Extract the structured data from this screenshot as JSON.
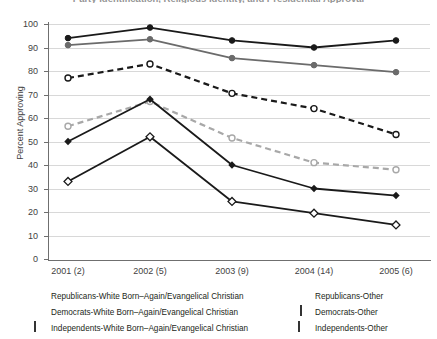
{
  "chart_data": {
    "type": "line",
    "title": "Party Identification, Religious Identity, and Presidential Approval",
    "xlabel": "",
    "ylabel": "Percent Approving",
    "categories": [
      "2001 (2)",
      "2002 (5)",
      "2003 (9)",
      "2004 (14)",
      "2005 (6)"
    ],
    "ylim": [
      0,
      100
    ],
    "yticks": [
      0,
      10,
      20,
      30,
      40,
      50,
      60,
      70,
      80,
      90,
      100
    ],
    "grid": true,
    "legend_position": "below",
    "series": [
      {
        "name": "Republicans-White Born–Again/Evangelical Christian",
        "values": [
          94,
          98.5,
          93,
          90,
          93
        ],
        "color": "#1a1a1a",
        "style": "solid",
        "marker": "filled-circle"
      },
      {
        "name": "Republicans-Other",
        "values": [
          91,
          93.5,
          85.5,
          82.5,
          79.5
        ],
        "color": "#6b6b6b",
        "style": "solid",
        "marker": "filled-circle"
      },
      {
        "name": "Independents-White Born–Again/Evangelical Christian",
        "values": [
          77,
          83,
          70.5,
          64,
          53
        ],
        "color": "#1a1a1a",
        "style": "dashed",
        "marker": "open-circle"
      },
      {
        "name": "Independents-Other",
        "values": [
          56.5,
          67,
          51.5,
          41,
          38
        ],
        "color": "#a8a8a8",
        "style": "dashed",
        "marker": "open-circle"
      },
      {
        "name": "Democrats-White Born–Again/Evangelical Christian",
        "values": [
          50,
          68,
          40,
          30,
          27
        ],
        "color": "#1a1a1a",
        "style": "solid",
        "marker": "filled-diamond"
      },
      {
        "name": "Democrats-Other",
        "values": [
          33,
          52,
          24.5,
          19.5,
          14.5
        ],
        "color": "#1a1a1a",
        "style": "solid",
        "marker": "open-diamond"
      }
    ]
  },
  "axis": {
    "y_title": "Percent Approving",
    "y_tick_labels": [
      "100",
      "90",
      "80",
      "70",
      "60",
      "50",
      "40",
      "30",
      "20",
      "10",
      "0"
    ],
    "x_tick_labels": [
      "2001 (2)",
      "2002 (5)",
      "2003 (9)",
      "2004 (14)",
      "2005 (6)"
    ]
  },
  "legend": {
    "left": [
      {
        "label": "Republicans-White Born–Again/Evangelical Christian",
        "marker": "filled-square-black"
      },
      {
        "label": "Democrats-White Born–Again/Evangelical Christian",
        "marker": "filled-diamond-black"
      },
      {
        "label": "Independents-White Born–Again/Evangelical Christian",
        "marker": "open-square"
      }
    ],
    "right": [
      {
        "label": "Republicans-Other",
        "marker": "filled-square-gray"
      },
      {
        "label": "Democrats-Other",
        "marker": "open-diamond"
      },
      {
        "label": "Independents-Other",
        "marker": "open-square"
      }
    ]
  }
}
